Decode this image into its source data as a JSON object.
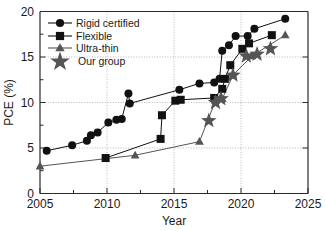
{
  "chart_data": {
    "type": "scatter",
    "title": "",
    "xlabel": "Year",
    "ylabel": "PCE (%)",
    "xlim": [
      2005,
      2025
    ],
    "ylim": [
      0,
      20
    ],
    "xticks": [
      2005,
      2010,
      2015,
      2020,
      2025
    ],
    "yticks": [
      0,
      5,
      10,
      15,
      20
    ],
    "xtick_labels": [
      "2005",
      "2010",
      "2015",
      "2020",
      "2025"
    ],
    "ytick_labels": [
      "0",
      "5",
      "10",
      "15",
      "20"
    ],
    "grid": "dotted major gridlines on both axes",
    "legend_position": "upper left inside axes",
    "series": [
      {
        "name": "Rigid certified",
        "marker": "circle",
        "color": "#111111",
        "points": [
          [
            2005.5,
            4.7
          ],
          [
            2007.4,
            5.3
          ],
          [
            2008.5,
            5.8
          ],
          [
            2008.8,
            6.4
          ],
          [
            2009.3,
            6.7
          ],
          [
            2010.1,
            7.8
          ],
          [
            2010.7,
            8.1
          ],
          [
            2011.1,
            8.2
          ],
          [
            2011.6,
            11.0
          ],
          [
            2011.7,
            9.9
          ],
          [
            2015.4,
            11.4
          ],
          [
            2016.9,
            12.1
          ],
          [
            2018.0,
            12.2
          ],
          [
            2018.4,
            12.6
          ],
          [
            2018.6,
            15.7
          ],
          [
            2019.1,
            16.3
          ],
          [
            2019.6,
            17.3
          ],
          [
            2020.5,
            17.3
          ],
          [
            2021.0,
            18.1
          ],
          [
            2023.3,
            19.2
          ]
        ]
      },
      {
        "name": "Flexible",
        "marker": "square",
        "color": "#111111",
        "points": [
          [
            2009.9,
            3.9
          ],
          [
            2014.0,
            6.0
          ],
          [
            2014.1,
            8.6
          ],
          [
            2015.1,
            10.2
          ],
          [
            2015.5,
            10.3
          ],
          [
            2018.0,
            10.5
          ],
          [
            2018.6,
            11.5
          ],
          [
            2018.8,
            12.6
          ],
          [
            2019.2,
            14.1
          ],
          [
            2020.1,
            15.9
          ],
          [
            2020.6,
            16.5
          ],
          [
            2022.3,
            17.4
          ]
        ]
      },
      {
        "name": "Ultra-thin",
        "marker": "triangle",
        "color": "#555555",
        "points": [
          [
            2005.0,
            3.0
          ],
          [
            2012.1,
            4.2
          ],
          [
            2016.9,
            5.7
          ],
          [
            2018.1,
            10.2
          ],
          [
            2018.6,
            10.4
          ],
          [
            2019.4,
            13.0
          ],
          [
            2020.8,
            15.1
          ],
          [
            2023.3,
            17.4
          ]
        ]
      },
      {
        "name": "Our group",
        "marker": "star",
        "color": "#555555",
        "points": [
          [
            2017.6,
            8.0
          ],
          [
            2018.1,
            10.0
          ],
          [
            2018.5,
            10.4
          ],
          [
            2019.4,
            13.0
          ],
          [
            2020.4,
            15.1
          ],
          [
            2021.2,
            15.3
          ],
          [
            2022.2,
            15.9
          ]
        ]
      }
    ],
    "legend": [
      {
        "label": "Rigid certified",
        "marker": "circle"
      },
      {
        "label": "Flexible",
        "marker": "square"
      },
      {
        "label": "Ultra-thin",
        "marker": "triangle"
      },
      {
        "label": "Our group",
        "marker": "star"
      }
    ]
  },
  "axes": {
    "x_title": "Year",
    "y_title": "PCE (%)",
    "x_tick_0": "2005",
    "x_tick_1": "2010",
    "x_tick_2": "2015",
    "x_tick_3": "2020",
    "x_tick_4": "2025",
    "y_tick_0": "0",
    "y_tick_1": "5",
    "y_tick_2": "10",
    "y_tick_3": "15",
    "y_tick_4": "20"
  },
  "legend": {
    "item_0": "Rigid certified",
    "item_1": "Flexible",
    "item_2": "Ultra-thin",
    "item_3": "Our group"
  },
  "colors": {
    "axis": "#2b2b2b",
    "grid": "#9a9a9a",
    "dark_marker": "#111111",
    "gray_marker": "#555555",
    "background": "#ffffff"
  }
}
